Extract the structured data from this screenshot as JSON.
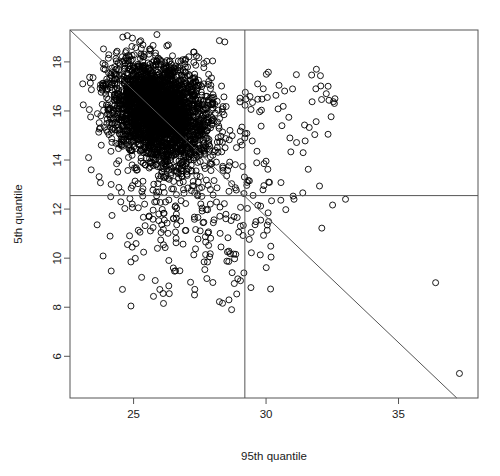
{
  "chart_data": {
    "type": "scatter",
    "title": "",
    "subtitle": "",
    "xlabel": "95th quantile",
    "ylabel": "5th quantile",
    "xlim": [
      22.6,
      38.0
    ],
    "ylim": [
      4.3,
      19.3
    ],
    "xticks": [
      25,
      30,
      35
    ],
    "xtick_labels": [
      "25",
      "30",
      "35"
    ],
    "yticks": [
      6,
      8,
      10,
      12,
      14,
      16,
      18
    ],
    "ytick_labels": [
      "6",
      "8",
      "10",
      "12",
      "14",
      "16",
      "18"
    ],
    "grid": false,
    "legend": null,
    "point_marker": "open-circle",
    "point_color": "#000000",
    "point_radius_px": 3.0,
    "frame_color": "#555555",
    "annotations": [
      {
        "name": "vertical-threshold-line",
        "kind": "vline",
        "x": 29.2
      },
      {
        "name": "horizontal-threshold-line",
        "kind": "hline",
        "y": 12.55
      },
      {
        "name": "diagonal-boundary-line",
        "kind": "segment",
        "x0": 22.6,
        "y0": 19.3,
        "x1": 37.2,
        "y1": 4.3
      }
    ],
    "cluster_summary": {
      "center_x": 26.0,
      "center_y": 16.0,
      "n_points_approx": 3000,
      "description": "dense ellipsoidal cloud of open circles centred near (26, 16) with a long tail of sparse outliers toward larger 95th quantile and smaller 5th quantile"
    },
    "notable_outliers": [
      {
        "x": 36.4,
        "y": 9.0
      },
      {
        "x": 37.3,
        "y": 5.3
      },
      {
        "x": 33.0,
        "y": 12.4
      },
      {
        "x": 24.9,
        "y": 8.05
      },
      {
        "x": 27.3,
        "y": 8.5
      },
      {
        "x": 28.6,
        "y": 8.3
      },
      {
        "x": 28.7,
        "y": 7.9
      },
      {
        "x": 23.4,
        "y": 13.6
      },
      {
        "x": 23.3,
        "y": 14.1
      },
      {
        "x": 23.1,
        "y": 16.25
      },
      {
        "x": 31.9,
        "y": 17.7
      },
      {
        "x": 32.6,
        "y": 16.5
      },
      {
        "x": 31.0,
        "y": 16.9
      },
      {
        "x": 30.6,
        "y": 15.4
      },
      {
        "x": 30.9,
        "y": 14.9
      },
      {
        "x": 31.4,
        "y": 14.3
      },
      {
        "x": 30.1,
        "y": 13.1
      },
      {
        "x": 29.8,
        "y": 11.55
      },
      {
        "x": 26.5,
        "y": 9.6
      },
      {
        "x": 25.9,
        "y": 10.4
      }
    ]
  }
}
